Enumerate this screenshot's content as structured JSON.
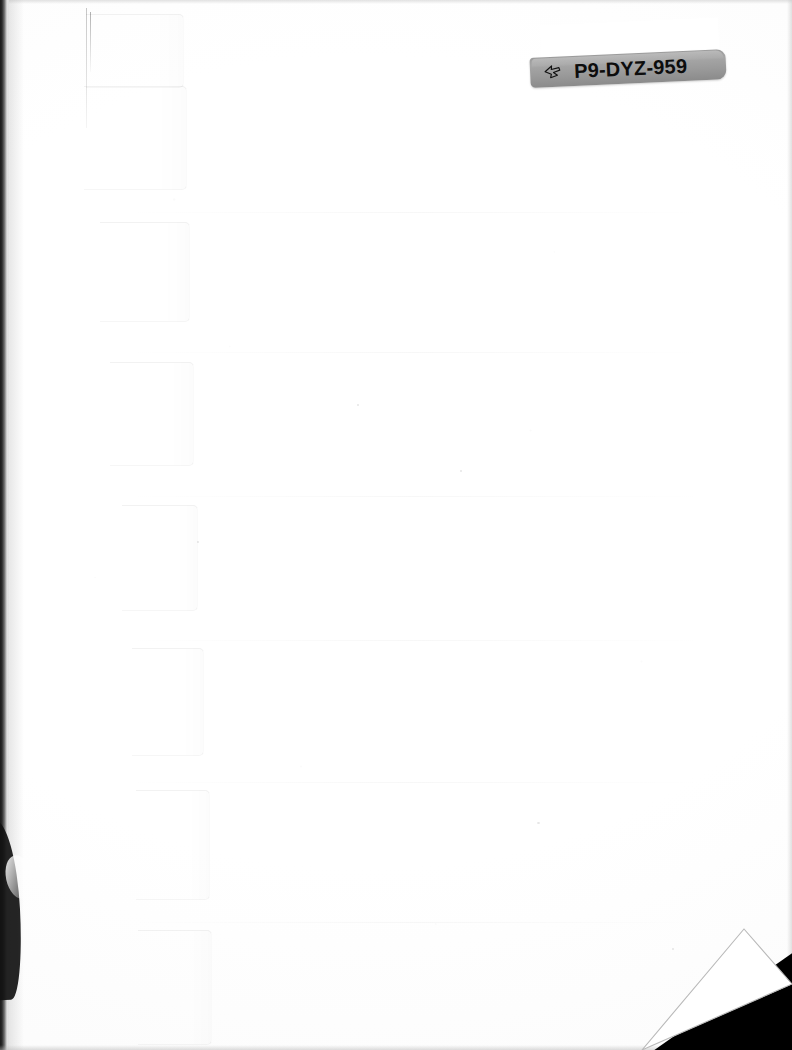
{
  "document": {
    "kind": "scanned-page",
    "description": "Blank white back cover / index-divider page of a scanned book",
    "width": 792,
    "height": 1050,
    "background_color": "#ffffff"
  },
  "barcode_label": {
    "name": "library-barcode-label",
    "code_text": "P9-DYZ-959",
    "icon": "pointing-hand-icon",
    "plate_color": "#9b9b9b",
    "text_color": "#0d0d0d",
    "bar_color": "#0b0b0b",
    "rotation_deg": -2.6,
    "bar_widths": [
      3,
      1,
      2,
      1,
      1,
      3,
      1,
      4,
      1,
      2,
      1,
      3,
      1,
      1,
      2,
      1,
      4,
      1,
      2,
      1,
      1,
      3,
      1,
      2,
      1,
      4,
      1,
      1,
      2,
      1,
      3,
      1,
      2,
      1,
      1,
      4,
      1,
      2,
      1,
      3,
      1,
      1,
      2,
      1,
      4,
      1,
      1,
      2,
      1,
      3,
      1,
      2,
      1,
      1,
      4,
      1,
      2,
      1,
      3,
      1,
      1,
      2,
      1,
      4,
      1,
      2,
      1,
      1,
      3,
      1,
      2,
      1,
      4,
      1,
      1,
      2,
      1,
      3,
      1,
      2,
      1,
      1,
      4,
      1,
      3,
      1,
      2,
      1,
      1,
      3,
      1,
      4,
      1,
      2,
      1,
      1,
      3,
      1,
      2,
      1,
      4,
      1,
      1,
      2,
      1,
      3,
      1,
      2,
      1,
      1,
      4,
      1,
      2,
      1,
      3,
      1,
      3
    ],
    "bar_gaps": [
      1,
      1,
      1,
      2,
      1,
      1,
      2,
      1,
      1,
      1,
      2,
      1,
      1,
      2,
      1,
      1,
      1,
      2,
      1,
      1,
      2,
      1,
      1,
      1,
      2,
      1,
      2,
      1,
      1,
      2,
      1,
      1,
      1,
      2,
      1,
      1,
      2,
      1,
      1,
      1,
      2,
      1,
      1,
      2,
      1,
      2,
      1,
      1,
      1,
      2,
      1,
      1,
      2,
      1,
      1,
      1,
      2,
      1,
      1,
      2,
      1,
      1,
      1,
      2,
      1,
      1,
      2,
      1,
      1,
      1,
      2,
      1,
      1,
      2,
      1,
      1,
      1,
      2,
      1,
      1,
      2,
      1,
      1,
      1,
      2,
      1,
      1,
      2,
      1,
      1,
      1,
      2,
      1,
      1,
      2,
      1,
      1,
      1,
      2,
      1,
      1,
      2,
      1,
      1,
      1,
      2,
      1,
      1,
      2,
      1,
      1,
      1,
      2,
      1,
      1,
      1,
      1
    ]
  },
  "index_tabs": {
    "name": "index-divider-tabs",
    "count": 7,
    "edge_color": "#f0f0f0",
    "items": [
      {
        "label": "tab-1",
        "x": 86,
        "y": 14,
        "w": 98,
        "h": 74
      },
      {
        "label": "tab-2",
        "x": 84,
        "y": 86,
        "w": 103,
        "h": 104
      },
      {
        "label": "tab-3",
        "x": 100,
        "y": 222,
        "w": 90,
        "h": 100
      },
      {
        "label": "tab-4",
        "x": 110,
        "y": 362,
        "w": 84,
        "h": 104
      },
      {
        "label": "tab-5",
        "x": 122,
        "y": 505,
        "w": 76,
        "h": 106
      },
      {
        "label": "tab-6",
        "x": 132,
        "y": 648,
        "w": 72,
        "h": 108
      },
      {
        "label": "tab-7",
        "x": 136,
        "y": 790,
        "w": 74,
        "h": 110
      },
      {
        "label": "tab-8",
        "x": 138,
        "y": 930,
        "w": 74,
        "h": 115
      }
    ]
  },
  "creases": {
    "name": "paper-creases",
    "positions": [
      212,
      352,
      496,
      640,
      782,
      922
    ]
  },
  "corner_fold": {
    "name": "page-corner-fold",
    "shadow_color": "#000000",
    "flap_color": "#ffffff"
  },
  "scan_edges": {
    "name": "scan-border-shadows",
    "left_color": "#1a1a1a",
    "right_color": "#c8c8c8"
  }
}
